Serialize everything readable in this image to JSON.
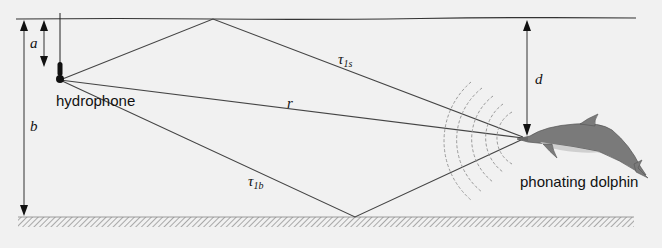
{
  "figure": {
    "type": "acoustic multipath geometry diagram",
    "labels": {
      "hydrophone": "hydrophone",
      "dolphin": "phonating dolphin",
      "depth_hydrophone": "a",
      "water_depth": "b",
      "depth_dolphin": "d",
      "direct_path": "r",
      "surface_path": "τ",
      "surface_path_sub": "1s",
      "bottom_path": "τ",
      "bottom_path_sub": "1b"
    },
    "colors": {
      "background": "#f1f1f1",
      "lines": "#333333",
      "dolphin_body": "#7a7a7a",
      "dolphin_belly": "#cfcfcf",
      "wavefronts": "#9a9a9a",
      "seabed_hatch": "#8a8a8a"
    }
  }
}
